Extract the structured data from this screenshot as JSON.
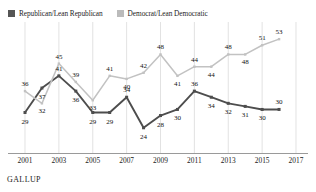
{
  "legend": {
    "position": "top-left",
    "entries": [
      {
        "label": "Republican/Lean Republican",
        "color": "#555555",
        "icon": "square-swatch-icon"
      },
      {
        "label": "Democrat/Lean Democratic",
        "color": "#bbbbbb",
        "icon": "square-swatch-icon"
      }
    ]
  },
  "source": {
    "label": "GALLUP"
  },
  "chart_data": {
    "type": "line",
    "title": "",
    "subtitle": "",
    "xlabel": "",
    "ylabel": "",
    "grid": "vertical",
    "legend_position": "top-left",
    "x": [
      2001,
      2002,
      2003,
      2004,
      2005,
      2006,
      2007,
      2008,
      2009,
      2010,
      2011,
      2012,
      2013,
      2014,
      2015,
      2016,
      2017
    ],
    "xtick_labels": [
      "2001",
      "2003",
      "2005",
      "2007",
      "2009",
      "2011",
      "2013",
      "2015",
      "2017"
    ],
    "xtick_values": [
      2001,
      2003,
      2005,
      2007,
      2009,
      2011,
      2013,
      2015,
      2017
    ],
    "xlim": [
      2000.5,
      2017.5
    ],
    "ylim": [
      20,
      56
    ],
    "series": [
      {
        "name": "Republican/Lean Republican",
        "color": "#4d4d4d",
        "values": [
          29,
          37,
          41,
          36,
          29,
          29,
          34,
          24,
          28,
          30,
          36,
          34,
          32,
          31,
          30,
          30
        ],
        "x": [
          2001,
          2002,
          2003,
          2004,
          2005,
          2006,
          2007,
          2008,
          2009,
          2010,
          2011,
          2012,
          2013,
          2014,
          2015,
          2016
        ],
        "labels": [
          "29",
          "37",
          "41",
          "36",
          "29",
          "29",
          "34",
          "24",
          "28",
          "30",
          "36",
          "34",
          "32",
          "31",
          "30",
          "30"
        ]
      },
      {
        "name": "Democrat/Lean Democratic",
        "color": "#c2c2c2",
        "values": [
          36,
          32,
          45,
          39,
          33,
          41,
          40,
          42,
          48,
          41,
          44,
          44,
          48,
          48,
          51,
          53
        ],
        "x": [
          2001,
          2002,
          2003,
          2004,
          2005,
          2006,
          2007,
          2008,
          2009,
          2010,
          2011,
          2012,
          2013,
          2014,
          2015,
          2016
        ],
        "labels": [
          "36",
          "32",
          "45",
          "39",
          "33",
          "41",
          "40",
          "42",
          "48",
          "41",
          "44",
          "44",
          "48",
          "48",
          "51",
          "53"
        ]
      }
    ]
  }
}
